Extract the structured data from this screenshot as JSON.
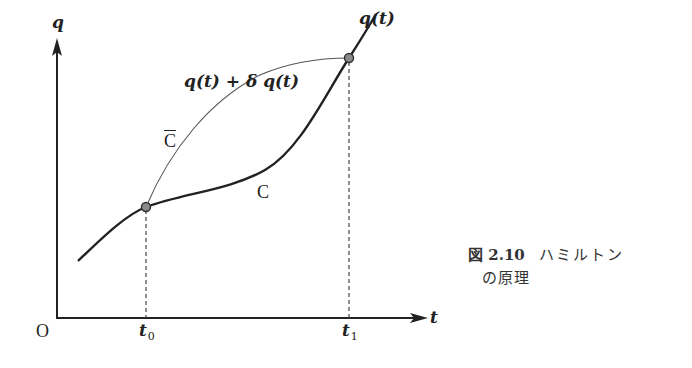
{
  "diagram": {
    "axes": {
      "y_label": "q",
      "x_label": "t",
      "origin_label": "O",
      "x_ticks": [
        {
          "label": "t",
          "sub": "0",
          "x": 146
        },
        {
          "label": "t",
          "sub": "1",
          "x": 349
        }
      ]
    },
    "curves": {
      "actual": {
        "name": "C",
        "label": "q(t)"
      },
      "varied": {
        "name": "C",
        "overbar": true,
        "label": "q(t) + δ q(t)"
      }
    },
    "points": [
      {
        "name": "start-point",
        "at": "t0"
      },
      {
        "name": "end-point",
        "at": "t1"
      }
    ],
    "colors": {
      "line": "#222222",
      "thin_line": "#555555",
      "dashed": "#444444",
      "point_fill": "#888888"
    }
  },
  "caption": {
    "figure_number": "図 2.10",
    "title_line1": "ハミルトン",
    "title_line2": "の原理"
  }
}
